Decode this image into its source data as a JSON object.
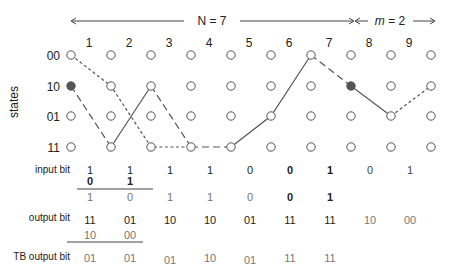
{
  "header": {
    "n_label": "N = 7",
    "m_label_italic": "m",
    "m_label_rest": " = 2"
  },
  "column_numbers": [
    "1",
    "2",
    "3",
    "4",
    "5",
    "6",
    "7",
    "8",
    "9"
  ],
  "axis_label": "states",
  "states": [
    "00",
    "10",
    "01",
    "11"
  ],
  "rows": {
    "input_label": "input bit",
    "output_label": "output bit",
    "tb_label": "TB output bit"
  },
  "input_bits": [
    "1",
    "1",
    "1",
    "1",
    "0",
    "0",
    "1",
    "0",
    "1"
  ],
  "input_bits_extra": [
    "0",
    "1"
  ],
  "decoded_bits": [
    "1",
    "0",
    "1",
    "1",
    "0",
    "0",
    "1"
  ],
  "output_bits": [
    "11",
    "01",
    "10",
    "10",
    "01",
    "11",
    "11",
    "10",
    "00"
  ],
  "output_bits_extra": [
    "10",
    "00"
  ],
  "tb_output_bits": [
    "01",
    "01",
    "01",
    "10",
    "01",
    "11",
    "11"
  ],
  "trellis": {
    "columns": 10,
    "filled_nodes": [
      {
        "col": 0,
        "state": "10"
      },
      {
        "col": 7,
        "state": "10"
      }
    ],
    "colors": {
      "line": "#555555",
      "node_fill": "#555555"
    }
  }
}
